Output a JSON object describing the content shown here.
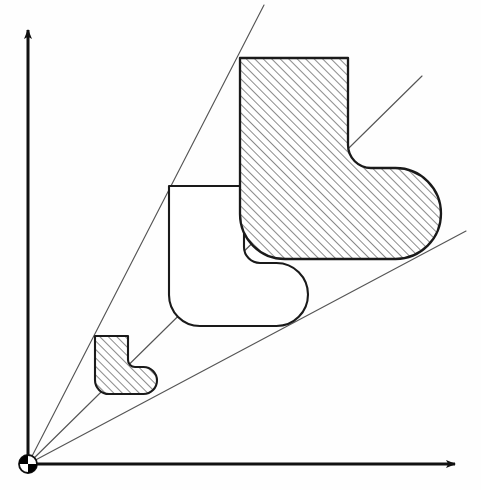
{
  "figure": {
    "background_color": "#fefefe",
    "stroke_color": "#1a1a1a",
    "ray_color": "#555555",
    "hatch_color": "#333333",
    "width": 481,
    "height": 490
  },
  "origin": {
    "label": "origin-center-of-homothety",
    "x": 28,
    "y": 464,
    "radius": 9,
    "style": "quartered-circle",
    "quadrant_fill_a": "#000000",
    "quadrant_fill_b": "#ffffff"
  },
  "axes": {
    "y_axis": {
      "name": "y-axis",
      "x1": 28,
      "y1": 464,
      "x2": 28,
      "y2": 30,
      "arrow": "up",
      "width": 3
    },
    "x_axis": {
      "name": "x-axis",
      "x1": 28,
      "y1": 464,
      "x2": 455,
      "y2": 464,
      "arrow": "right",
      "width": 3
    }
  },
  "rays": [
    {
      "name": "ray-through-top-left-corners",
      "x1": 28,
      "y1": 464,
      "x2": 264,
      "y2": 5
    },
    {
      "name": "ray-through-inner-notch-corners",
      "x1": 28,
      "y1": 464,
      "x2": 422,
      "y2": 76
    },
    {
      "name": "ray-through-bottom-right-corners",
      "x1": 28,
      "y1": 464,
      "x2": 466,
      "y2": 231
    }
  ],
  "shapes": [
    {
      "name": "small-boot-shape",
      "scale": "k1",
      "hatched": true,
      "fill": "none",
      "bbox": {
        "x": 95,
        "y": 336,
        "width": 62,
        "height": 58
      },
      "corner_radius_outer": 14,
      "corner_radius_inner": 7,
      "leg_width": 33,
      "foot_height": 27
    },
    {
      "name": "medium-boot-shape",
      "scale": "k2",
      "hatched": false,
      "fill": "#ffffff",
      "bbox": {
        "x": 169,
        "y": 186,
        "width": 139,
        "height": 140
      },
      "corner_radius_outer": 31,
      "corner_radius_inner": 16,
      "leg_width": 75,
      "foot_height": 63
    },
    {
      "name": "large-boot-shape",
      "scale": "k3",
      "hatched": true,
      "fill": "none",
      "bbox": {
        "x": 240,
        "y": 58,
        "width": 201,
        "height": 201
      },
      "corner_radius_outer": 45,
      "corner_radius_inner": 23,
      "leg_width": 108,
      "foot_height": 91
    }
  ],
  "hatch": {
    "name": "diagonal-hatch-pattern",
    "angle_degrees": 45,
    "direction": "bottom-left-to-top-right",
    "spacing_px": 6,
    "line_width": 1.1,
    "color": "#2a2a2a"
  }
}
